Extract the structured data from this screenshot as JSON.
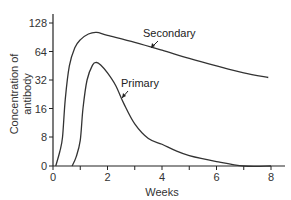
{
  "chart_data": {
    "type": "line",
    "title": "",
    "xlabel": "Weeks",
    "ylabel": "Concentration of antibody",
    "xlim": [
      0,
      8
    ],
    "ylim_labels": [
      0,
      8,
      16,
      32,
      64,
      128
    ],
    "y_scale": "log2 (with 0 baseline)",
    "x_tick_labels": [
      "0",
      "2",
      "4",
      "6",
      "8"
    ],
    "x_minor_ticks": [
      1,
      3,
      5,
      7
    ],
    "y_tick_labels": [
      "0",
      "8",
      "16",
      "32",
      "64",
      "128"
    ],
    "grid": false,
    "legend": "none (direct annotations with arrows)",
    "series": [
      {
        "name": "Secondary",
        "points": [
          [
            0.1,
            0
          ],
          [
            0.25,
            2
          ],
          [
            0.35,
            8
          ],
          [
            0.45,
            20
          ],
          [
            0.6,
            45
          ],
          [
            0.8,
            70
          ],
          [
            1.0,
            85
          ],
          [
            1.3,
            98
          ],
          [
            1.6,
            102
          ],
          [
            2.0,
            95
          ],
          [
            3.0,
            80
          ],
          [
            4.0,
            66
          ],
          [
            5.0,
            54
          ],
          [
            6.0,
            45
          ],
          [
            7.0,
            38
          ],
          [
            7.9,
            34
          ]
        ]
      },
      {
        "name": "Primary",
        "points": [
          [
            0.7,
            0
          ],
          [
            0.85,
            1
          ],
          [
            1.0,
            6
          ],
          [
            1.1,
            16
          ],
          [
            1.25,
            32
          ],
          [
            1.45,
            46
          ],
          [
            1.6,
            49
          ],
          [
            1.75,
            46
          ],
          [
            2.0,
            38
          ],
          [
            2.3,
            28
          ],
          [
            2.6,
            18
          ],
          [
            3.0,
            11
          ],
          [
            3.5,
            7
          ],
          [
            4.0,
            4.2
          ],
          [
            4.5,
            2.2
          ],
          [
            5.0,
            1.2
          ],
          [
            6.0,
            0.4
          ],
          [
            7.0,
            0
          ],
          [
            8.0,
            0
          ]
        ]
      }
    ],
    "annotations": [
      {
        "text": "Secondary",
        "points_to_x": 3.5
      },
      {
        "text": "Primary",
        "points_to_x": 2.5
      }
    ]
  }
}
